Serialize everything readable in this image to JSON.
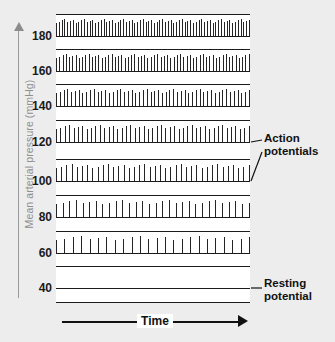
{
  "figure": {
    "background_color": "#ededed",
    "panel_color": "#ffffff",
    "trace_color": "#1b1b1b",
    "axis_color": "#8f8f8f"
  },
  "y_axis": {
    "label": "Mean arterial pressure (mmHg)",
    "arrow": "up-arrow-icon",
    "ticks": [
      "180",
      "160",
      "140",
      "120",
      "100",
      "80",
      "60",
      "40"
    ]
  },
  "x_axis": {
    "label": "Time",
    "arrow": "right-arrow-icon"
  },
  "annotations": {
    "action_potentials": "Action\npotentials",
    "resting_potential": "Resting\npotential"
  },
  "chart_data": {
    "type": "line",
    "title": "",
    "xlabel": "Time",
    "ylabel": "Mean arterial pressure (mmHg)",
    "grid": false,
    "legend": "none",
    "categories": [
      180,
      160,
      140,
      120,
      100,
      80,
      60,
      40
    ],
    "series": [
      {
        "name": "Action potential count per trace",
        "values": [
          70,
          60,
          52,
          45,
          38,
          30,
          24,
          0
        ]
      }
    ],
    "traces": [
      {
        "pressure": "180",
        "spike_count": 70,
        "y": 36,
        "label": "180"
      },
      {
        "pressure": "160",
        "spike_count": 60,
        "y": 71,
        "label": "160"
      },
      {
        "pressure": "140",
        "spike_count": 52,
        "y": 106,
        "label": "140"
      },
      {
        "pressure": "120",
        "spike_count": 45,
        "y": 142,
        "label": "120"
      },
      {
        "pressure": "100",
        "spike_count": 38,
        "y": 181,
        "label": "100"
      },
      {
        "pressure": "80",
        "spike_count": 30,
        "y": 217,
        "label": "80"
      },
      {
        "pressure": "60",
        "spike_count": 24,
        "y": 253,
        "label": "60"
      },
      {
        "pressure": "40",
        "spike_count": 0,
        "y": 288,
        "label": "40"
      }
    ],
    "ylim": [
      40,
      180
    ],
    "ytick_labels": [
      "40",
      "60",
      "80",
      "100",
      "120",
      "140",
      "160",
      "180"
    ]
  }
}
